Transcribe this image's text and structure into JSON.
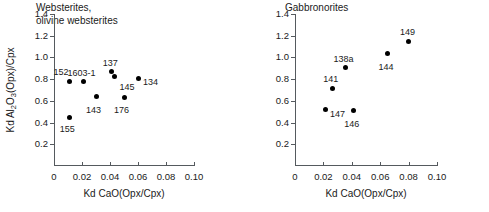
{
  "figure": {
    "xlabel": "Kd CaO(Opx/Cpx)",
    "ylabel_main": "Kd Al",
    "ylabel_sub1": "2",
    "ylabel_mid": "O",
    "ylabel_sub2": "3",
    "ylabel_tail": "(Opx)/Cpx"
  },
  "chart_data": [
    {
      "type": "scatter",
      "title": "Websterites,\nolivine websterites",
      "xlabel": "Kd CaO(Opx/Cpx)",
      "ylabel": "Kd Al2O3(Opx)/Cpx",
      "xlim": [
        0,
        0.1
      ],
      "ylim": [
        0,
        1.4
      ],
      "xticks": [
        0,
        0.02,
        0.04,
        0.06,
        0.08,
        0.1
      ],
      "xticklabels": [
        "0",
        "0.02",
        "0.04",
        "0.06",
        "0.08",
        "0.10"
      ],
      "yticks": [
        0.2,
        0.4,
        0.6,
        0.8,
        1.0,
        1.2,
        1.4
      ],
      "yticklabels": [
        "0.2",
        "0.4",
        "0.6",
        "0.8",
        "1.0",
        "1.2",
        "1.4"
      ],
      "grid": false,
      "legend": "none",
      "marker": "filled-circle",
      "points": [
        {
          "label": "152",
          "x": 0.011,
          "y": 0.78,
          "label_dx": -16,
          "label_dy": -13
        },
        {
          "label": "155",
          "x": 0.0112,
          "y": 0.45,
          "label_dx": -10,
          "label_dy": 8
        },
        {
          "label": "1603-1",
          "x": 0.021,
          "y": 0.775,
          "label_dx": -16,
          "label_dy": -13
        },
        {
          "label": "143",
          "x": 0.03,
          "y": 0.64,
          "label_dx": -10,
          "label_dy": 9
        },
        {
          "label": "137",
          "x": 0.0412,
          "y": 0.87,
          "label_dx": -9,
          "label_dy": -13
        },
        {
          "label": "145",
          "x": 0.0432,
          "y": 0.82,
          "label_dx": 5,
          "label_dy": 6
        },
        {
          "label": "176",
          "x": 0.05,
          "y": 0.635,
          "label_dx": -10,
          "label_dy": 9
        },
        {
          "label": "134",
          "x": 0.06,
          "y": 0.81,
          "label_dx": 5,
          "label_dy": 0
        }
      ]
    },
    {
      "type": "scatter",
      "title": "Gabbronorites",
      "xlabel": "Kd CaO(Opx/Cpx)",
      "ylabel": "",
      "xlim": [
        0,
        0.1
      ],
      "ylim": [
        0,
        1.4
      ],
      "xticks": [
        0,
        0.02,
        0.04,
        0.06,
        0.08,
        0.1
      ],
      "xticklabels": [
        "0",
        "0.02",
        "0.04",
        "0.06",
        "0.08",
        "0.10"
      ],
      "yticks": [
        0.2,
        0.4,
        0.6,
        0.8,
        1.0,
        1.2,
        1.4
      ],
      "yticklabels": [
        "0.2",
        "0.4",
        "0.6",
        "0.8",
        "1.0",
        "1.2",
        "1.4"
      ],
      "grid": false,
      "legend": "none",
      "marker": "filled-circle",
      "points": [
        {
          "label": "147",
          "x": 0.0212,
          "y": 0.52,
          "label_dx": 5,
          "label_dy": 0
        },
        {
          "label": "141",
          "x": 0.0262,
          "y": 0.715,
          "label_dx": -9,
          "label_dy": -13
        },
        {
          "label": "138a",
          "x": 0.0355,
          "y": 0.905,
          "label_dx": -12,
          "label_dy": -13
        },
        {
          "label": "146",
          "x": 0.041,
          "y": 0.51,
          "label_dx": -9,
          "label_dy": 9
        },
        {
          "label": "144",
          "x": 0.0652,
          "y": 1.035,
          "label_dx": -9,
          "label_dy": 9
        },
        {
          "label": "149",
          "x": 0.0802,
          "y": 1.15,
          "label_dx": -9,
          "label_dy": -13
        }
      ]
    }
  ]
}
